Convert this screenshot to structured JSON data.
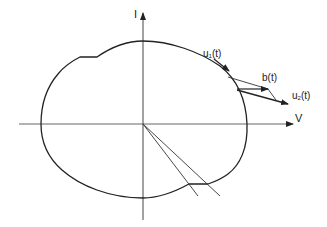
{
  "diagram": {
    "type": "phase-plane closed curve with vectors",
    "axes": {
      "x_label": "V",
      "y_label": "I"
    },
    "vector_labels": {
      "u1": {
        "base": "u",
        "sub": "1",
        "arg": "(t)"
      },
      "b": {
        "text": "b(t)"
      },
      "u2": {
        "base": "u",
        "sub": "2",
        "arg": "(t)"
      }
    },
    "colors": {
      "stroke": "#222222",
      "axis": "#555555",
      "background": "#ffffff"
    }
  }
}
